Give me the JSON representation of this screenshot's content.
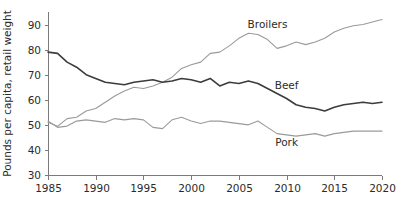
{
  "chart_data": {
    "type": "line",
    "title": "",
    "xlabel": "",
    "ylabel": "Pounds per capita, retail weight",
    "xlim": [
      1985,
      2020
    ],
    "ylim": [
      30,
      95
    ],
    "ytick_values": [
      30,
      40,
      50,
      60,
      70,
      80,
      90
    ],
    "ytick_labels": [
      "30",
      "40",
      "50",
      "60",
      "70",
      "80",
      "90"
    ],
    "xtick_values": [
      1985,
      1990,
      1995,
      2000,
      2005,
      2010,
      2015,
      2020
    ],
    "xtick_labels": [
      "1985",
      "1990",
      "1995",
      "2000",
      "2005",
      "2010",
      "2015",
      "2020"
    ],
    "grid": false,
    "legend_position": "inline-annotations",
    "x": [
      1985,
      1986,
      1987,
      1988,
      1989,
      1990,
      1991,
      1992,
      1993,
      1994,
      1995,
      1996,
      1997,
      1998,
      1999,
      2000,
      2001,
      2002,
      2003,
      2004,
      2005,
      2006,
      2007,
      2008,
      2009,
      2010,
      2011,
      2012,
      2013,
      2014,
      2015,
      2016,
      2017,
      2018,
      2019,
      2020
    ],
    "series": [
      {
        "name": "Broilers",
        "color": "#9a9a9a",
        "label_x": 2008,
        "label_y": 88.5,
        "values": [
          51.0,
          49.4,
          52.5,
          53.0,
          55.5,
          56.5,
          59.0,
          61.5,
          63.5,
          65.0,
          64.5,
          65.5,
          67.0,
          69.0,
          72.5,
          74.0,
          75.0,
          78.5,
          79.0,
          81.5,
          84.5,
          86.5,
          86.0,
          84.0,
          80.5,
          81.5,
          83.0,
          82.0,
          83.0,
          84.5,
          87.0,
          88.5,
          89.5,
          90.0,
          91.0,
          92.0
        ]
      },
      {
        "name": "Beef",
        "color": "#3c3c3c",
        "label_x": 2010,
        "label_y": 64.5,
        "values": [
          79.0,
          78.5,
          75.0,
          73.0,
          70.0,
          68.5,
          67.0,
          66.5,
          66.0,
          67.0,
          67.5,
          68.0,
          67.0,
          67.5,
          68.5,
          68.0,
          67.0,
          68.5,
          65.5,
          67.0,
          66.5,
          67.5,
          66.5,
          64.5,
          62.5,
          60.5,
          58.0,
          57.0,
          56.5,
          55.5,
          57.0,
          58.0,
          58.5,
          59.0,
          58.5,
          59.0
        ]
      },
      {
        "name": "Pork",
        "color": "#9a9a9a",
        "label_x": 2010,
        "label_y": 41.5,
        "values": [
          51.5,
          49.0,
          49.5,
          51.5,
          52.0,
          51.5,
          51.0,
          52.5,
          52.0,
          52.5,
          52.0,
          49.0,
          48.5,
          52.0,
          53.0,
          51.5,
          50.5,
          51.5,
          51.5,
          51.0,
          50.5,
          50.0,
          51.5,
          49.0,
          46.5,
          46.0,
          45.5,
          46.0,
          46.5,
          45.5,
          46.5,
          47.0,
          47.5,
          47.5,
          47.5,
          47.5
        ]
      }
    ]
  },
  "geometry": {
    "plot_left": 48,
    "plot_right": 382,
    "plot_top": 12,
    "plot_bottom": 175
  }
}
